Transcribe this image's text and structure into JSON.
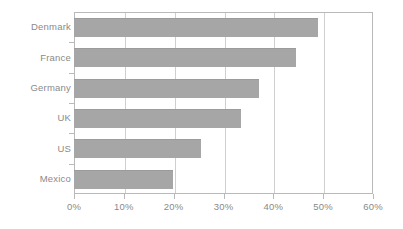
{
  "chart_data": {
    "type": "bar",
    "orientation": "horizontal",
    "title": "",
    "subtitle": "",
    "xlabel": "",
    "ylabel": "",
    "categories": [
      "Denmark",
      "France",
      "Germany",
      "UK",
      "US",
      "Mexico"
    ],
    "values": [
      49,
      44.6,
      37.1,
      33.5,
      25.5,
      19.9
    ],
    "value_suffix": "%",
    "xlim": [
      0,
      60
    ],
    "xticks": [
      0,
      10,
      20,
      30,
      40,
      50,
      60
    ],
    "xtick_labels": [
      "0%",
      "10%",
      "20%",
      "30%",
      "40%",
      "50%",
      "60%"
    ],
    "grid": "vertical",
    "legend": "none",
    "series": [
      {
        "name": "",
        "values": [
          49,
          44.6,
          37.1,
          33.5,
          25.5,
          19.9
        ]
      }
    ],
    "colors": {
      "bar": "#a6a6a6",
      "bar_edge": "#9b9b9b",
      "gridline": "#cfcfcf",
      "axis": "#b9b9b9",
      "text": "#8a8a8a",
      "background": "#ffffff"
    }
  }
}
